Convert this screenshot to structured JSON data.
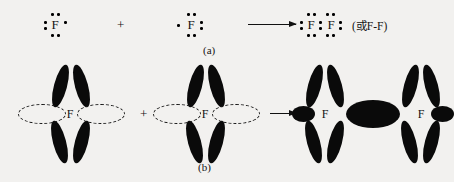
{
  "figure": {
    "caption_a": "(a)",
    "caption_b": "(b)",
    "element_symbol": "F",
    "plus_a": "+",
    "plus_b": "+",
    "arrow_a": "arrow-right",
    "arrow_b": "arrow-right",
    "product_note": "(或F-F)",
    "ink_color": "#0a0a0a",
    "background_color": "#f2f1ef"
  },
  "row_a": {
    "label": "(a)",
    "reactant_1": {
      "symbol": "F",
      "description": "fluorine atom Lewis structure with seven valence electrons",
      "lone_pairs": [
        "top",
        "left",
        "bottom"
      ],
      "single_electron": "right"
    },
    "reactant_2": {
      "symbol": "F",
      "description": "fluorine atom Lewis structure with seven valence electrons",
      "lone_pairs": [
        "top",
        "right",
        "bottom"
      ],
      "single_electron": "left"
    },
    "product": {
      "symbol_left": "F",
      "symbol_right": "F",
      "description": "F2 molecule Lewis structure with one shared electron pair",
      "shared_pair": "center",
      "note": "(或F-F)"
    }
  },
  "row_b": {
    "label": "(b)",
    "reactant_1": {
      "symbol": "F",
      "filled_lobes": 4,
      "half_filled_lobes": 2,
      "half_filled_style": "dashed-outline"
    },
    "reactant_2": {
      "symbol": "F",
      "filled_lobes": 4,
      "half_filled_lobes": 2,
      "half_filled_style": "dashed-outline"
    },
    "product": {
      "symbol_left": "F",
      "symbol_right": "F",
      "filled_lobes_each": 4,
      "overlap_region": "merged-sigma-bond",
      "outer_lobes": 2
    }
  }
}
